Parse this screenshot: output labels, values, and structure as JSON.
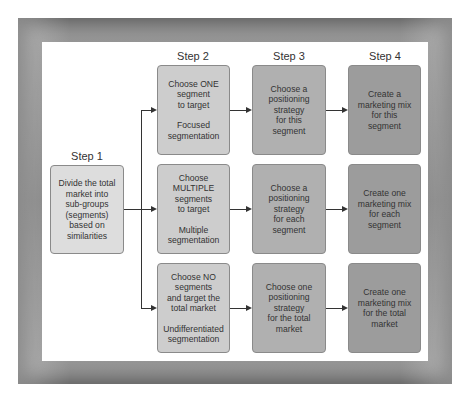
{
  "diagram": {
    "steps": [
      {
        "label": "Step 1"
      },
      {
        "label": "Step 2"
      },
      {
        "label": "Step 3"
      },
      {
        "label": "Step 4"
      }
    ],
    "step1_box": {
      "lines": [
        "Divide the total",
        "market into",
        "sub-groups",
        "(segments)",
        "based on",
        "similarities"
      ]
    },
    "rows": [
      {
        "step2": {
          "lines": [
            "Choose ONE",
            "segment",
            "to target"
          ],
          "type": "Focused segmentation",
          "type_lines": [
            "Focused",
            "segmentation"
          ]
        },
        "step3": {
          "lines": [
            "Choose a",
            "positioning",
            "strategy",
            "for this",
            "segment"
          ]
        },
        "step4": {
          "lines": [
            "Create a",
            "marketing mix",
            "for this",
            "segment"
          ]
        }
      },
      {
        "step2": {
          "lines": [
            "Choose",
            "MULTIPLE",
            "segments",
            "to target"
          ],
          "type": "Multiple segmentation",
          "type_lines": [
            "Multiple",
            "segmentation"
          ]
        },
        "step3": {
          "lines": [
            "Choose a",
            "positioning",
            "strategy",
            "for each",
            "segment"
          ]
        },
        "step4": {
          "lines": [
            "Create one",
            "marketing mix",
            "for each",
            "segment"
          ]
        }
      },
      {
        "step2": {
          "lines": [
            "Choose NO",
            "segments",
            "and target the",
            "total market"
          ],
          "type": "Undifferentiated segmentation",
          "type_lines": [
            "Undifferentiated",
            "segmentation"
          ]
        },
        "step3": {
          "lines": [
            "Choose one",
            "positioning",
            "strategy",
            "for the total",
            "market"
          ]
        },
        "step4": {
          "lines": [
            "Create one",
            "marketing mix",
            "for the total",
            "market"
          ]
        }
      }
    ],
    "colors": {
      "step1": "#dddddd",
      "step2": "#cdcdcd",
      "step3": "#b0b0b0",
      "step4": "#9c9c9c",
      "frame": "#8a8a8a"
    }
  }
}
